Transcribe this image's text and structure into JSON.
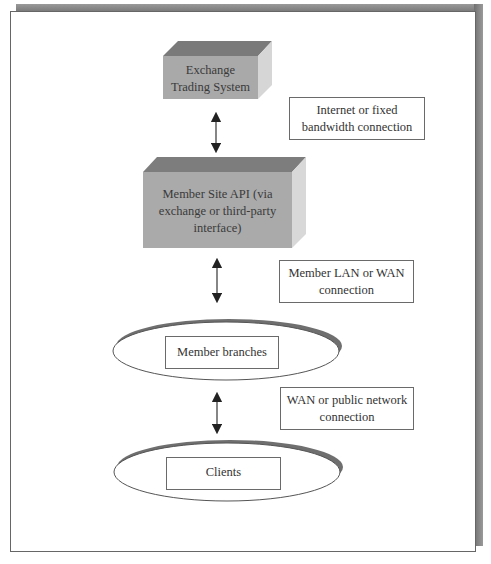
{
  "diagram": {
    "nodes": [
      {
        "id": "exchange",
        "shape": "3d-box",
        "lines": [
          "Exchange",
          "Trading System"
        ]
      },
      {
        "id": "member_api",
        "shape": "3d-box",
        "lines": [
          "Member Site API (via",
          "exchange or third-party",
          "interface)"
        ]
      },
      {
        "id": "member_branches",
        "shape": "ellipse",
        "label": "Member branches"
      },
      {
        "id": "clients",
        "shape": "ellipse",
        "label": "Clients"
      }
    ],
    "connections": [
      {
        "from": "exchange",
        "to": "member_api",
        "arrow": "bidirectional",
        "lines": [
          "Internet or fixed",
          "bandwidth connection"
        ]
      },
      {
        "from": "member_api",
        "to": "member_branches",
        "arrow": "bidirectional",
        "lines": [
          "Member LAN or WAN",
          "connection"
        ]
      },
      {
        "from": "member_branches",
        "to": "clients",
        "arrow": "bidirectional",
        "lines": [
          "WAN or public network",
          "connection"
        ]
      }
    ]
  },
  "colors": {
    "box_front": "#a8a8a8",
    "box_top": "#7a7a7a",
    "box_side": "#d4d4d4",
    "frame_shadow": "#7c7c7c",
    "ellipse_shadow": "#6f6f6f",
    "border": "#666666"
  }
}
